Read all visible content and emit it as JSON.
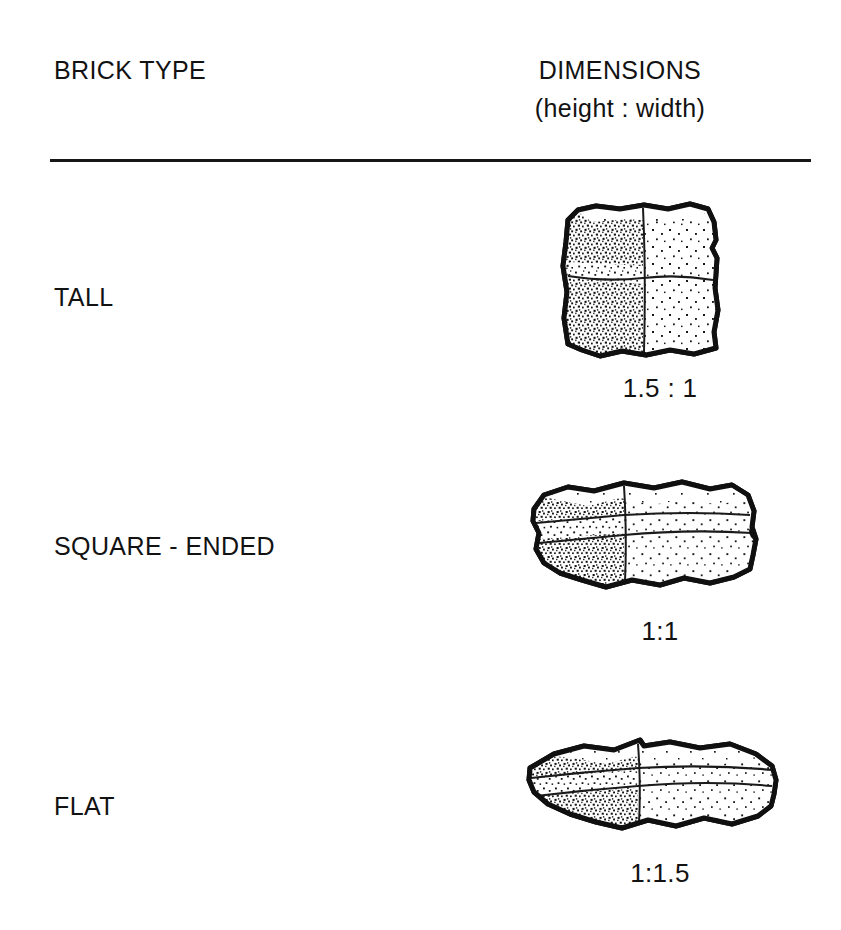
{
  "table": {
    "headers": {
      "brick_type": "BRICK TYPE",
      "dimensions": "DIMENSIONS",
      "dimensions_sub": "(height : width)"
    },
    "rows": [
      {
        "brick_type": "TALL",
        "dimensions": "1.5 : 1",
        "illustration": "tall-brick-illustration"
      },
      {
        "brick_type": "SQUARE - ENDED",
        "dimensions": "1:1",
        "illustration": "square-ended-brick-illustration"
      },
      {
        "brick_type": "FLAT",
        "dimensions": "1:1.5",
        "illustration": "flat-brick-illustration"
      }
    ]
  },
  "style": {
    "background": "#ffffff",
    "ink": "#121212",
    "rule": "#17171a"
  }
}
